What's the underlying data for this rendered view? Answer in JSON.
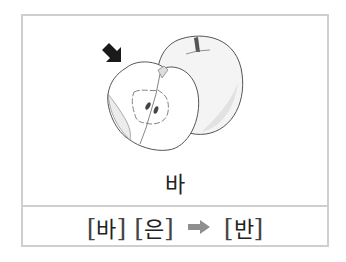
{
  "card": {
    "word": "바",
    "illustration": {
      "subject": "apple-cut-in-half",
      "pointer_icon": "arrow-down-right-icon",
      "pointer_color": "#1a1a1a"
    },
    "rule": {
      "syllable_1": "바",
      "syllable_2_initial": "으",
      "syllable_2_final_hint": "ㄴ",
      "syllable_2": "은",
      "arrow_icon": "arrow-right-icon",
      "arrow_color": "#8f8f8f",
      "result": "반",
      "open_bracket": "[",
      "close_bracket": "]"
    }
  },
  "colors": {
    "border": "#cfcfcf",
    "text": "#222222",
    "highlight_final": "#9a9a9a"
  }
}
